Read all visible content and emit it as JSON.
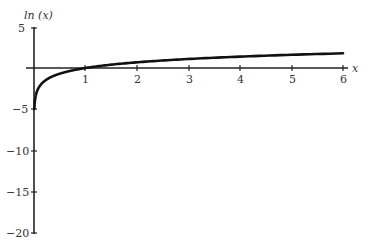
{
  "chart_data": {
    "type": "line",
    "title": "",
    "xlabel": "x",
    "ylabel": "ln (x)",
    "xlim": [
      0,
      6
    ],
    "ylim": [
      -20,
      5
    ],
    "x_ticks": [
      "1",
      "2",
      "3",
      "4",
      "5",
      "6"
    ],
    "y_ticks": [
      "5",
      "-5",
      "-10",
      "-15",
      "-20"
    ],
    "grid": false,
    "legend": null,
    "series": [
      {
        "name": "ln(x)",
        "function": "ln(x)",
        "x": [
          0.0067,
          0.05,
          0.1,
          0.25,
          0.5,
          0.75,
          1,
          1.5,
          2,
          3,
          4,
          5,
          6
        ],
        "y": [
          -5.0,
          -3.0,
          -2.3,
          -1.39,
          -0.69,
          -0.29,
          0,
          0.41,
          0.69,
          1.1,
          1.39,
          1.61,
          1.79
        ]
      }
    ]
  },
  "labels": {
    "ylabel": "ln (x)",
    "xlabel": "x",
    "x_ticks": [
      "1",
      "2",
      "3",
      "4",
      "5",
      "6"
    ],
    "y_ticks": [
      "5",
      "−5",
      "−10",
      "−15",
      "−20"
    ]
  }
}
